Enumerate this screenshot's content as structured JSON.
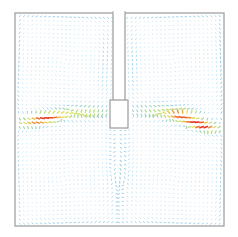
{
  "figure": {
    "width": 238,
    "height": 237
  },
  "domain_geometry": {
    "outer_box": {
      "x": 15,
      "y": 13,
      "w": 209,
      "h": 213
    },
    "top_partition": {
      "x": 113,
      "y": 13,
      "w": 12,
      "h": 88
    },
    "obstacle": {
      "x": 110,
      "y": 100,
      "w": 18,
      "h": 28
    },
    "frame_color": "#9a9a9a"
  },
  "colors": {
    "low": "#a8d4ef",
    "mid_low": "#5fb3dc",
    "mid": "#8fd06a",
    "mid_high": "#e8e04a",
    "high": "#e8301e"
  },
  "chart_data": {
    "type": "vector_field",
    "title": "",
    "xlabel": "",
    "ylabel": "",
    "legend": [],
    "cells": [
      {
        "name": "upper-left vortex",
        "center": [
          64,
          62
        ],
        "rotation": "counterclockwise"
      },
      {
        "name": "upper-right vortex",
        "center": [
          174,
          62
        ],
        "rotation": "clockwise"
      },
      {
        "name": "lower vortex pair",
        "center": [
          119,
          180
        ],
        "rotation": "split"
      }
    ],
    "jets": [
      {
        "name": "left jet",
        "from": [
          18,
          122
        ],
        "to": [
          108,
          110
        ],
        "peak_color": "#e8301e"
      },
      {
        "name": "right jet",
        "from": [
          222,
          126
        ],
        "to": [
          130,
          110
        ],
        "peak_color": "#e8301e"
      }
    ]
  }
}
